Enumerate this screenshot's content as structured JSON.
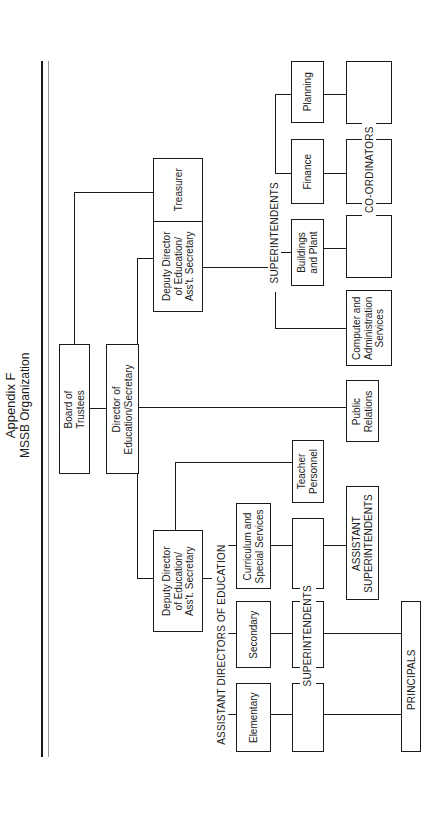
{
  "title": {
    "line1": "Appendix F",
    "line2": "MSSB Organization"
  },
  "nodes": {
    "board": "Board of\nTrustees",
    "director": "Director of\nEducation/Secretary",
    "treasurer": "Treasurer",
    "deputy_admin": "Deputy Director\nof Education/\nAss't. Secretary",
    "deputy_education": "Deputy Director\nof Education/\nAss't. Secretary",
    "public_relations": "Public\nRelations",
    "teacher_personnel": "Teacher\nPersonnel",
    "planning": "Planning",
    "finance": "Finance",
    "buildings": "Buildings\nand Plant",
    "computer_admin": "Computer and\nAdministration\nServices",
    "curriculum": "Curriculum and\nSpecial Services",
    "secondary": "Secondary",
    "elementary": "Elementary",
    "assistant_superintendents": "ASSISTANT\nSUPERINTENDENTS"
  },
  "group_labels": {
    "superintendents_admin": "SUPERINTENDENTS",
    "coordinators": "CO-ORDINATORS",
    "assistant_directors": "ASSISTANT DIRECTORS OF EDUCATION",
    "superintendents_education": "SUPERINTENDENTS",
    "principals": "PRINCIPALS"
  },
  "colors": {
    "line": "#1a1a1a",
    "background": "#ffffff"
  }
}
